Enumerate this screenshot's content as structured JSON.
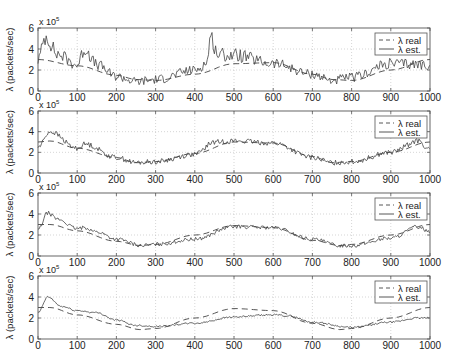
{
  "figure": {
    "panel_count": 4,
    "x_ticks": [
      0,
      100,
      200,
      300,
      400,
      500,
      600,
      700,
      800,
      900,
      1000
    ],
    "y_ticks": [
      0,
      2,
      4,
      6
    ],
    "y_scale_label": "x 10",
    "y_scale_exp": "5",
    "ylabel": "λ (packets/sec)",
    "legend": [
      {
        "label": "λ real",
        "style": "dashed"
      },
      {
        "label": "λ est.",
        "style": "solid"
      }
    ],
    "colors": {
      "line": "#444444",
      "axis": "#555555",
      "grid": "#bbbbbb"
    }
  },
  "chart_data": [
    {
      "type": "line",
      "title": "",
      "xlabel": "",
      "ylabel": "λ (packets/sec) x 10^5",
      "xlim": [
        0,
        1000
      ],
      "ylim": [
        0,
        6
      ],
      "grid": true,
      "legend_position": "upper right",
      "series": [
        {
          "name": "λ real",
          "x": [
            0,
            100,
            200,
            250,
            300,
            400,
            500,
            600,
            700,
            750,
            800,
            900,
            1000
          ],
          "values": [
            3.0,
            2.4,
            1.5,
            1.1,
            1.0,
            1.6,
            2.6,
            2.7,
            1.6,
            1.1,
            1.0,
            2.0,
            3.0
          ]
        },
        {
          "name": "λ est.",
          "x": [
            0,
            20,
            50,
            100,
            120,
            150,
            200,
            250,
            300,
            400,
            430,
            440,
            460,
            500,
            600,
            700,
            750,
            800,
            900,
            1000
          ],
          "values": [
            3.0,
            5.2,
            3.5,
            2.5,
            4.0,
            2.5,
            1.4,
            0.9,
            1.1,
            2.0,
            2.6,
            5.1,
            3.5,
            3.4,
            2.6,
            1.6,
            1.0,
            1.3,
            2.6,
            2.5
          ]
        }
      ]
    },
    {
      "type": "line",
      "xlim": [
        0,
        1000
      ],
      "ylim": [
        0,
        6
      ],
      "grid": true,
      "legend_position": "upper right",
      "series": [
        {
          "name": "λ real",
          "x": [
            0,
            30,
            100,
            200,
            250,
            300,
            400,
            500,
            600,
            700,
            750,
            800,
            900,
            1000
          ],
          "values": [
            3.0,
            3.1,
            2.4,
            1.5,
            1.0,
            1.1,
            1.9,
            3.0,
            2.9,
            1.6,
            1.0,
            1.1,
            2.0,
            3.0
          ]
        },
        {
          "name": "λ est.",
          "x": [
            0,
            30,
            100,
            120,
            200,
            250,
            300,
            400,
            450,
            500,
            600,
            700,
            750,
            800,
            900,
            970,
            1000
          ],
          "values": [
            2.5,
            4.0,
            2.4,
            2.8,
            1.5,
            1.0,
            1.1,
            1.8,
            3.0,
            3.1,
            2.9,
            1.5,
            1.0,
            1.1,
            2.0,
            3.1,
            2.2
          ]
        }
      ]
    },
    {
      "type": "line",
      "xlim": [
        0,
        1000
      ],
      "ylim": [
        0,
        6
      ],
      "grid": true,
      "legend_position": "upper right",
      "series": [
        {
          "name": "λ real",
          "x": [
            0,
            30,
            100,
            200,
            260,
            300,
            400,
            500,
            600,
            700,
            770,
            800,
            900,
            1000
          ],
          "values": [
            3.0,
            3.0,
            2.4,
            1.4,
            1.0,
            1.1,
            2.0,
            2.9,
            2.7,
            1.5,
            1.0,
            1.1,
            2.0,
            3.0
          ]
        },
        {
          "name": "λ est.",
          "x": [
            0,
            25,
            50,
            100,
            120,
            150,
            200,
            265,
            300,
            400,
            500,
            600,
            700,
            770,
            800,
            900,
            970,
            1000
          ],
          "values": [
            2.5,
            4.1,
            3.5,
            2.6,
            2.7,
            2.3,
            1.6,
            1.0,
            1.1,
            1.6,
            2.8,
            2.7,
            1.6,
            1.0,
            1.0,
            1.7,
            2.8,
            2.3
          ]
        }
      ]
    },
    {
      "type": "line",
      "xlim": [
        0,
        1000
      ],
      "ylim": [
        0,
        6
      ],
      "grid": true,
      "legend_position": "upper right",
      "series": [
        {
          "name": "λ real",
          "x": [
            0,
            30,
            100,
            200,
            260,
            300,
            400,
            500,
            600,
            700,
            770,
            800,
            900,
            1000
          ],
          "values": [
            3.0,
            3.0,
            2.3,
            1.4,
            0.9,
            1.0,
            2.0,
            2.9,
            2.7,
            1.5,
            0.9,
            1.0,
            2.0,
            3.0
          ]
        },
        {
          "name": "λ est.",
          "x": [
            0,
            25,
            60,
            100,
            150,
            200,
            250,
            300,
            400,
            500,
            600,
            640,
            700,
            800,
            900,
            970,
            1000
          ],
          "values": [
            2.5,
            4.0,
            3.1,
            2.7,
            2.5,
            1.8,
            1.3,
            1.2,
            1.5,
            2.1,
            2.3,
            2.2,
            1.6,
            1.1,
            1.6,
            2.0,
            2.0
          ]
        }
      ]
    }
  ]
}
